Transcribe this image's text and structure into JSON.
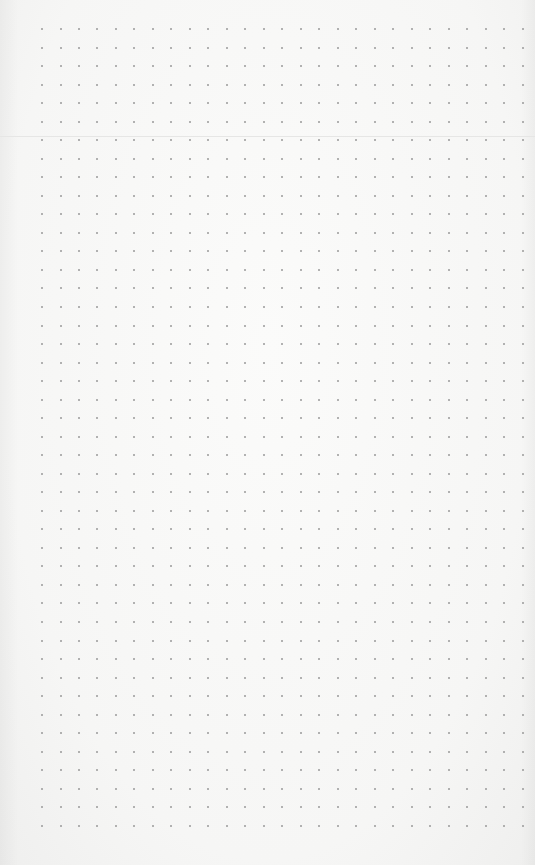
{
  "page": {
    "type": "dot-grid-paper",
    "background_color": "#f7f7f6",
    "dot_color": "#9a9a9a",
    "grid": {
      "origin_x": 42,
      "origin_y": 29,
      "spacing_x": 18.48,
      "spacing_y": 18.53,
      "columns": 27,
      "rows": 44,
      "dot_size": 2
    },
    "fold_line": {
      "y": 136,
      "color": "#e6e6e5"
    }
  }
}
